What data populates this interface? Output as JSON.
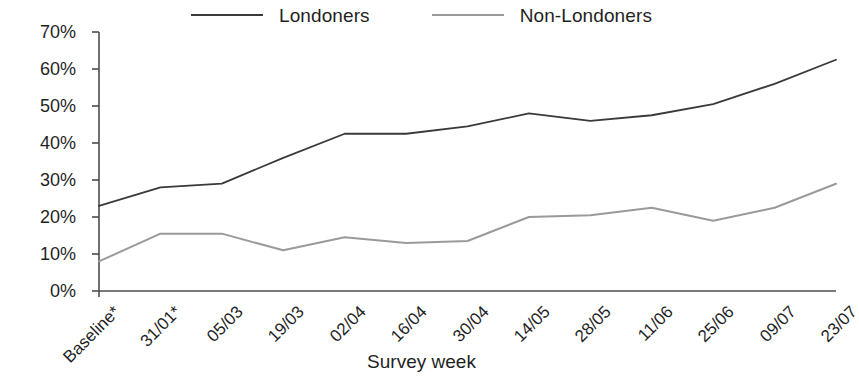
{
  "chart_data": {
    "type": "line",
    "title": "",
    "xlabel": "Survey week",
    "ylabel": "",
    "ylim": [
      0,
      70
    ],
    "ytick_labels": [
      "0%",
      "10%",
      "20%",
      "30%",
      "40%",
      "50%",
      "60%",
      "70%"
    ],
    "ytick_values": [
      0,
      10,
      20,
      30,
      40,
      50,
      60,
      70
    ],
    "grid": false,
    "legend_position": "top-center",
    "categories": [
      "Baseline*",
      "31/01*",
      "05/03",
      "19/03",
      "02/04",
      "16/04",
      "30/04",
      "14/05",
      "28/05",
      "11/06",
      "25/06",
      "09/07",
      "23/07"
    ],
    "series": [
      {
        "name": "Londoners",
        "color": "#3a3a3a",
        "values": [
          23,
          28,
          29,
          36,
          42.5,
          42.5,
          44.5,
          48,
          46,
          47.5,
          50.5,
          56,
          62.5
        ]
      },
      {
        "name": "Non-Londoners",
        "color": "#9a9a9a",
        "values": [
          8,
          15.5,
          15.5,
          11,
          14.5,
          13,
          13.5,
          20,
          20.5,
          22.5,
          19,
          22.5,
          29
        ]
      }
    ]
  },
  "legend": {
    "entries": [
      {
        "label": "Londoners",
        "color": "#3a3a3a"
      },
      {
        "label": "Non-Londoners",
        "color": "#9a9a9a"
      }
    ]
  },
  "axes": {
    "x_title": "Survey week",
    "axis_color": "#4d4d4d"
  }
}
